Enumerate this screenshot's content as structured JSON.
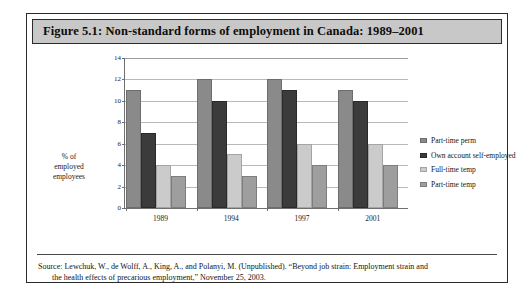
{
  "figure": {
    "title": "Figure 5.1: Non-standard forms of employment in Canada: 1989–2001",
    "source_line_1": "Source: Lewchuk, W., de Wolff, A., King, A., and Polanyi, M. (Unpublished). “Beyond job strain: Employment strain and",
    "source_line_2": "the health effects of precarious employment,” November 25, 2003."
  },
  "chart_data": {
    "type": "bar",
    "title": "Figure 5.1: Non-standard forms of employment in Canada: 1989–2001",
    "categories": [
      "1989",
      "1994",
      "1997",
      "2001"
    ],
    "series": [
      {
        "name": "Part-time perm",
        "values": [
          11,
          12,
          12,
          11
        ],
        "color": "#8a8a8a"
      },
      {
        "name": "Own account self-employed",
        "values": [
          7,
          10,
          11,
          10
        ],
        "color": "#3b3b3b"
      },
      {
        "name": "Full-time temp",
        "values": [
          4,
          5,
          6,
          6
        ],
        "color": "#cbcbcb"
      },
      {
        "name": "Part-time temp",
        "values": [
          3,
          3,
          4,
          4
        ],
        "color": "#9e9e9e"
      }
    ],
    "xlabel": "",
    "ylabel": "% of employed employees",
    "ylabel_lines": [
      "% of",
      "employed",
      "employees"
    ],
    "ylim": [
      0,
      14
    ],
    "yticks": [
      0,
      2,
      4,
      6,
      8,
      10,
      12,
      14
    ],
    "grid": true,
    "legend_position": "right"
  },
  "colors": {
    "title_bar_background": "#c8c8c8",
    "frame_border": "#2b2b2b",
    "gridline": "#b9b9b9",
    "axis": "#6f6f6f"
  }
}
